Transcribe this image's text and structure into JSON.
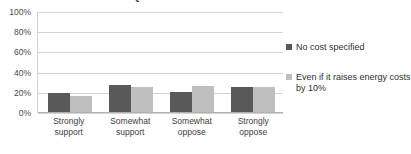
{
  "chart_data": {
    "type": "bar",
    "title": "SUPPORT FOR A REQUIREMENT THAT UTILITIES USE MORE RENEWABLE ENERGY",
    "xlabel": "",
    "ylabel": "",
    "ylim": [
      0,
      100
    ],
    "grid": true,
    "legend_position": "right",
    "categories": [
      "Strongly support",
      "Somewhat support",
      "Somewhat oppose",
      "Strongly oppose"
    ],
    "category_lines": [
      [
        "Strongly",
        "support"
      ],
      [
        "Somewhat",
        "support"
      ],
      [
        "Somewhat",
        "oppose"
      ],
      [
        "Strongly",
        "oppose"
      ]
    ],
    "ytick_labels": [
      "100%",
      "80%",
      "60%",
      "40%",
      "20%",
      "0%"
    ],
    "ytick_values": [
      100,
      80,
      60,
      40,
      20,
      0
    ],
    "series": [
      {
        "name": "No cost specified",
        "color": "#595959",
        "values": [
          19,
          27,
          20,
          25
        ]
      },
      {
        "name": "Even if it raises energy costs by 10%",
        "color": "#bfbfbf",
        "values": [
          16,
          25,
          26,
          25
        ]
      }
    ]
  },
  "legend": {
    "items": [
      {
        "label": "No cost specified"
      },
      {
        "label": "Even if it raises energy costs by 10%"
      }
    ]
  },
  "colors": {
    "series_0": "#595959",
    "series_1": "#bfbfbf",
    "gridline": "#d4d4d4",
    "text": "#3d3d3d",
    "background": "#ffffff"
  }
}
